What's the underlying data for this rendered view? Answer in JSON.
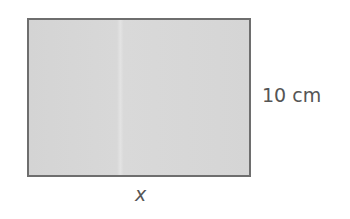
{
  "diagram": {
    "shape": "rectangle",
    "fill_color": "#d6d6d6",
    "stroke_color": "#6e6e6e",
    "labels": {
      "height": "10 cm",
      "width": "x"
    }
  }
}
